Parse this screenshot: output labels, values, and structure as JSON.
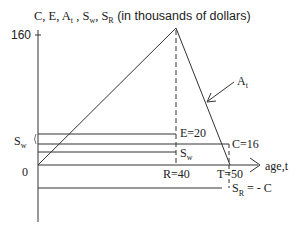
{
  "title": {
    "prefix": "C, E, A",
    "a_sub": "t",
    "mid1": " , S",
    "w_sub": "w",
    "mid2": ", S",
    "r_sub": "R",
    "suffix": " (in thousands of dollars)"
  },
  "y_axis": {
    "tick_top": "160",
    "origin": "0",
    "sw_label": "S",
    "sw_sub": "w"
  },
  "x_axis": {
    "label": "age,t",
    "r_label": "R=40",
    "t_label": "T=50"
  },
  "lines": {
    "e_label": "E=20",
    "c_label": "C=16",
    "sw_label": "S",
    "sw_sub": "w",
    "sr_label": "S",
    "sr_sub": "R",
    "sr_eq": " = - C",
    "at_label": "A",
    "at_sub": "t"
  },
  "colors": {
    "line": "#333333",
    "text": "#222222"
  }
}
